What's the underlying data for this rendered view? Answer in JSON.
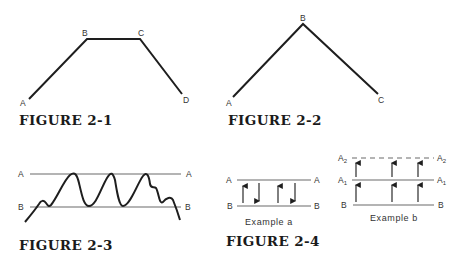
{
  "figures": {
    "fig_2_1": {
      "caption": "FIGURE 2-1",
      "points": {
        "A": "A",
        "B": "B",
        "C": "C",
        "D": "D"
      }
    },
    "fig_2_2": {
      "caption": "FIGURE 2-2",
      "points": {
        "A": "A",
        "B": "B",
        "C": "C"
      }
    },
    "fig_2_3": {
      "caption": "FIGURE 2-3",
      "lines": {
        "upper": "A",
        "lower": "B"
      }
    },
    "fig_2_4": {
      "caption": "FIGURE 2-4",
      "example_a": {
        "label": "Example a",
        "lines": {
          "upper": "A",
          "lower": "B"
        },
        "arrows": [
          "up",
          "down",
          "up",
          "down"
        ]
      },
      "example_b": {
        "label": "Example b",
        "lines": {
          "top_base": "A",
          "top_sub": "2",
          "mid_base": "A",
          "mid_sub": "1",
          "lower": "B"
        },
        "top_line_style": "dashed",
        "arrows": [
          "up",
          "up",
          "up"
        ]
      }
    }
  },
  "colors": {
    "ink": "#1e1e1e",
    "thin_line": "#6a6a6a",
    "background": "#ffffff"
  }
}
